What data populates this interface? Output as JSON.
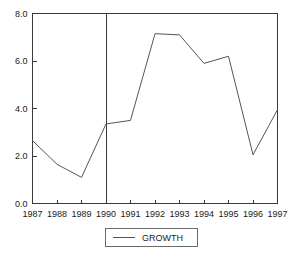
{
  "chart_data": {
    "type": "line",
    "title": "",
    "xlabel": "",
    "ylabel": "",
    "categories": [
      "1987",
      "1988",
      "1989",
      "1990",
      "1991",
      "1992",
      "1993",
      "1994",
      "1995",
      "1996",
      "1997"
    ],
    "series": [
      {
        "name": "GROWTH",
        "values": [
          2.65,
          1.65,
          1.1,
          3.35,
          3.5,
          7.15,
          7.1,
          5.9,
          6.2,
          2.05,
          3.95
        ]
      }
    ],
    "ylim": [
      0.0,
      8.0
    ],
    "yticks": [
      "0.0",
      "2.0",
      "4.0",
      "6.0",
      "8.0"
    ],
    "ytick_values": [
      0.0,
      2.0,
      4.0,
      6.0,
      8.0
    ],
    "xticks": [
      "1987",
      "1988",
      "1989",
      "1990",
      "1991",
      "1992",
      "1993",
      "1994",
      "1995",
      "1996",
      "1997"
    ],
    "grid": false,
    "legend_position": "bottom",
    "annotations": [
      {
        "type": "vertical-reference-line",
        "at_category": "1990",
        "label": ""
      }
    ],
    "colors": {
      "line": "#555555",
      "axis": "#3a3a3a",
      "text": "#1a1a1a",
      "background": "#ffffff",
      "legend_border": "#6a6a6a"
    }
  },
  "legend": {
    "entries": [
      {
        "label": "GROWTH"
      }
    ]
  }
}
